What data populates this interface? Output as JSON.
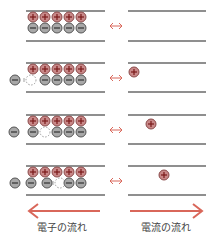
{
  "colors": {
    "plate": "#6a6a6a",
    "plus_fill": "#c88888",
    "plus_stroke": "#8a4a4a",
    "minus_fill": "#a8a8a8",
    "minus_stroke": "#555555",
    "arrow": "#d9675a",
    "hole": "#888888"
  },
  "rows": [
    {
      "y_top": 11,
      "y_bot": 41,
      "plus_left": [
        33,
        45,
        57,
        69,
        81
      ],
      "minus_left": [
        33,
        45,
        57,
        69,
        81
      ],
      "hole": null,
      "outside_minus": [],
      "plus_right": []
    },
    {
      "y_top": 63,
      "y_bot": 92,
      "plus_left": [
        33,
        45,
        57,
        69,
        81
      ],
      "minus_left": [
        45,
        57,
        69,
        81
      ],
      "hole": 31,
      "outside_minus": [
        15
      ],
      "plus_right": [
        134
      ]
    },
    {
      "y_top": 115,
      "y_bot": 144,
      "plus_left": [
        33,
        45,
        57,
        69,
        81
      ],
      "minus_left": [
        33,
        57,
        69,
        81
      ],
      "hole": 45,
      "outside_minus": [
        14
      ],
      "plus_right": [
        151
      ]
    },
    {
      "y_top": 166,
      "y_bot": 195,
      "plus_left": [
        33,
        45,
        57,
        69,
        81
      ],
      "minus_left": [
        31,
        47,
        69,
        81
      ],
      "hole": 60,
      "outside_minus": [
        15
      ],
      "plus_right": [
        164
      ]
    }
  ],
  "labels": {
    "electron_flow": "電子の流れ",
    "current_flow": "電流の流れ"
  }
}
